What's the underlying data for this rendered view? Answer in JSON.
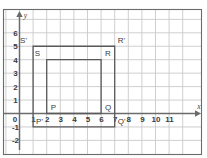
{
  "figure": {
    "title": "",
    "axis_labels": {
      "x": "x",
      "y": "y"
    },
    "x_ticks": [
      "0",
      "1",
      "2",
      "3",
      "4",
      "5",
      "6",
      "7",
      "8",
      "9",
      "10",
      "11"
    ],
    "y_ticks": [
      "6",
      "5",
      "4",
      "3",
      "2",
      "1",
      "0",
      "-1",
      "-2"
    ],
    "colors": {
      "grid": "#c9c9c9",
      "axis": "#6b6b6b",
      "shape": "#5a5a5a",
      "frame": "#6b6b6b",
      "text": "#3a3a3a",
      "background": "#ffffff"
    }
  },
  "chart_data": {
    "type": "scatter",
    "title": "",
    "xlabel": "x",
    "ylabel": "y",
    "xlim": [
      -1,
      12
    ],
    "ylim": [
      -2,
      6.6
    ],
    "grid": true,
    "legend": "none",
    "x_tick_values": [
      0,
      1,
      2,
      3,
      4,
      5,
      6,
      7,
      8,
      9,
      10,
      11
    ],
    "y_tick_values": [
      6,
      5,
      4,
      3,
      2,
      1,
      0,
      -1,
      -2
    ],
    "annotations": [
      {
        "label": "P",
        "x": 2,
        "y": 0,
        "label_dx": 4,
        "label_dy": -4
      },
      {
        "label": "Q",
        "x": 6,
        "y": 0,
        "label_dx": 4,
        "label_dy": -4
      },
      {
        "label": "R",
        "x": 6,
        "y": 4,
        "label_dx": 4,
        "label_dy": -4
      },
      {
        "label": "S",
        "x": 2,
        "y": 4,
        "label_dx": -12,
        "label_dy": -4
      },
      {
        "label": "P'",
        "x": 1,
        "y": -1,
        "label_dx": 3,
        "label_dy": -3
      },
      {
        "label": "Q'",
        "x": 7,
        "y": -1,
        "label_dx": 3,
        "label_dy": -3
      },
      {
        "label": "R'",
        "x": 7,
        "y": 5,
        "label_dx": 3,
        "label_dy": -3
      },
      {
        "label": "S'",
        "x": 1,
        "y": 5,
        "label_dx": -13,
        "label_dy": -3
      }
    ],
    "series": [
      {
        "name": "PQRS",
        "type": "rectangle",
        "vertices": [
          [
            2,
            0
          ],
          [
            6,
            0
          ],
          [
            6,
            4
          ],
          [
            2,
            4
          ]
        ],
        "closed": true,
        "x": [
          2,
          6,
          6,
          2,
          2
        ],
        "y": [
          0,
          0,
          4,
          4,
          0
        ]
      },
      {
        "name": "P'Q'R'S'",
        "type": "rectangle",
        "vertices": [
          [
            1,
            -1
          ],
          [
            7,
            -1
          ],
          [
            7,
            5
          ],
          [
            1,
            5
          ]
        ],
        "closed": true,
        "x": [
          1,
          7,
          7,
          1,
          1
        ],
        "y": [
          -1,
          -1,
          5,
          5,
          -1
        ]
      }
    ]
  }
}
